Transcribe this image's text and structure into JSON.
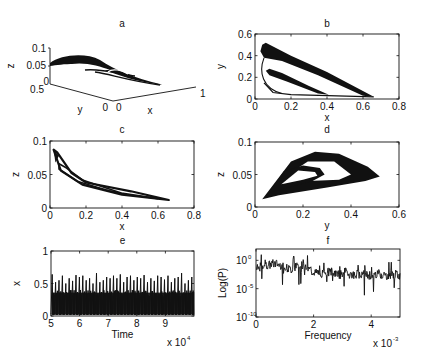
{
  "figure": {
    "background": "#ffffff",
    "ink": "#111111"
  },
  "chart_data": [
    {
      "id": "a",
      "title": "a",
      "type": "line3d",
      "xlabel": "x",
      "ylabel": "y",
      "zlabel": "z",
      "xlim": [
        0,
        1
      ],
      "ylim": [
        0,
        0.5
      ],
      "zlim": [
        0,
        0.1
      ],
      "xticks": [
        "0",
        "1"
      ],
      "yticks": [
        "0",
        "0.5"
      ],
      "zticks": [
        "0",
        "0.05",
        "0.1"
      ],
      "description": "3D phase portrait of chaotic attractor (x,y,z)"
    },
    {
      "id": "b",
      "title": "b",
      "type": "line",
      "xlabel": "x",
      "ylabel": "y",
      "xlim": [
        0,
        0.8
      ],
      "ylim": [
        0,
        0.6
      ],
      "xticks": [
        "0",
        "0.2",
        "0.4",
        "0.6",
        "0.8"
      ],
      "yticks": [
        "0",
        "0.2",
        "0.4",
        "0.6"
      ],
      "outer_band": [
        [
          0.04,
          0.5
        ],
        [
          0.06,
          0.52
        ],
        [
          0.2,
          0.4
        ],
        [
          0.4,
          0.25
        ],
        [
          0.66,
          0.02
        ],
        [
          0.6,
          0.03
        ],
        [
          0.35,
          0.22
        ],
        [
          0.15,
          0.35
        ],
        [
          0.05,
          0.38
        ],
        [
          0.03,
          0.44
        ]
      ],
      "inner_band": [
        [
          0.06,
          0.26
        ],
        [
          0.08,
          0.28
        ],
        [
          0.15,
          0.24
        ],
        [
          0.3,
          0.12
        ],
        [
          0.41,
          0.04
        ],
        [
          0.35,
          0.05
        ],
        [
          0.18,
          0.16
        ],
        [
          0.08,
          0.22
        ]
      ],
      "floor_line": [
        [
          0.05,
          0.15
        ],
        [
          0.1,
          0.06
        ],
        [
          0.2,
          0.04
        ],
        [
          0.66,
          0.02
        ]
      ]
    },
    {
      "id": "c",
      "title": "c",
      "type": "line",
      "xlabel": "x",
      "ylabel": "z",
      "xlim": [
        0,
        0.8
      ],
      "ylim": [
        0,
        0.1
      ],
      "xticks": [
        "0",
        "0.2",
        "0.4",
        "0.6",
        "0.8"
      ],
      "yticks": [
        "0",
        "0.05",
        "0.1"
      ],
      "loops": [
        [
          [
            0.66,
            0.012
          ],
          [
            0.4,
            0.02
          ],
          [
            0.18,
            0.035
          ],
          [
            0.06,
            0.056
          ],
          [
            0.02,
            0.087
          ],
          [
            0.04,
            0.083
          ],
          [
            0.12,
            0.052
          ],
          [
            0.2,
            0.038
          ],
          [
            0.45,
            0.025
          ],
          [
            0.66,
            0.012
          ]
        ],
        [
          [
            0.6,
            0.014
          ],
          [
            0.35,
            0.024
          ],
          [
            0.15,
            0.04
          ],
          [
            0.05,
            0.058
          ],
          [
            0.05,
            0.066
          ],
          [
            0.09,
            0.06
          ],
          [
            0.18,
            0.042
          ],
          [
            0.4,
            0.022
          ],
          [
            0.6,
            0.014
          ]
        ]
      ]
    },
    {
      "id": "d",
      "title": "d",
      "type": "line",
      "xlabel": "y",
      "ylabel": "z",
      "xlim": [
        0,
        0.6
      ],
      "ylim": [
        0,
        0.1
      ],
      "xticks": [
        "0",
        "0.2",
        "0.4",
        "0.6"
      ],
      "yticks": [
        "0",
        "0.05",
        "0.1"
      ],
      "outer_band": [
        [
          0.03,
          0.012
        ],
        [
          0.15,
          0.07
        ],
        [
          0.25,
          0.085
        ],
        [
          0.35,
          0.082
        ],
        [
          0.47,
          0.062
        ],
        [
          0.52,
          0.047
        ],
        [
          0.46,
          0.04
        ],
        [
          0.3,
          0.03
        ],
        [
          0.1,
          0.018
        ],
        [
          0.03,
          0.012
        ]
      ],
      "inner_band": [
        [
          0.06,
          0.022
        ],
        [
          0.12,
          0.055
        ],
        [
          0.2,
          0.064
        ],
        [
          0.27,
          0.06
        ],
        [
          0.29,
          0.05
        ],
        [
          0.24,
          0.04
        ],
        [
          0.12,
          0.028
        ],
        [
          0.06,
          0.022
        ]
      ],
      "hole_outer": [
        [
          0.13,
          0.048
        ],
        [
          0.22,
          0.07
        ],
        [
          0.33,
          0.07
        ],
        [
          0.4,
          0.05
        ],
        [
          0.35,
          0.042
        ],
        [
          0.22,
          0.04
        ]
      ],
      "hole_inner": [
        [
          0.11,
          0.035
        ],
        [
          0.18,
          0.056
        ],
        [
          0.25,
          0.054
        ],
        [
          0.26,
          0.048
        ],
        [
          0.2,
          0.042
        ]
      ]
    },
    {
      "id": "e",
      "title": "e",
      "type": "line",
      "xlabel": "Time",
      "ylabel": "x",
      "xlim": [
        5,
        10
      ],
      "ylim": [
        0,
        1
      ],
      "xticks": [
        "5",
        "6",
        "7",
        "8",
        "9"
      ],
      "yticks": [
        "0",
        "0.5",
        "1"
      ],
      "x_multiplier": "x 10",
      "x_multiplier_exp": "4",
      "peaks": [
        0.64,
        0.52,
        0.55,
        0.62,
        0.5,
        0.58,
        0.54,
        0.63,
        0.6,
        0.62,
        0.55,
        0.58,
        0.5,
        0.66,
        0.52,
        0.55,
        0.6,
        0.58,
        0.62,
        0.58,
        0.64,
        0.52,
        0.6,
        0.62,
        0.55,
        0.6,
        0.58,
        0.63,
        0.52,
        0.58,
        0.54,
        0.62,
        0.6,
        0.56,
        0.62,
        0.52,
        0.58,
        0.6,
        0.66,
        0.5,
        0.55,
        0.6
      ]
    },
    {
      "id": "f",
      "title": "f",
      "type": "line",
      "xlabel": "Frequency",
      "ylabel": "Log(P)",
      "xlim": [
        0,
        5
      ],
      "ylim": [
        -10,
        2
      ],
      "yscale": "log",
      "xticks": [
        "0",
        "2",
        "4"
      ],
      "yticks": [
        "10",
        "10",
        "10"
      ],
      "ytick_exps": [
        "0",
        "-5",
        "-10"
      ],
      "x_multiplier": "x 10",
      "x_multiplier_exp": "-3",
      "baseline_log": [
        -1.5,
        -1.2,
        -1.0,
        -0.8,
        -0.6,
        -0.6,
        -0.8,
        -1.0,
        -1.4,
        -1.6,
        -1.2,
        -0.9,
        -0.9,
        -1.2,
        -1.6,
        -2.0,
        -2.2,
        -2.4,
        -2.2,
        -2.1,
        -2.0,
        -2.3,
        -2.5,
        -2.2,
        -2.1,
        -2.4,
        -2.6,
        -2.4,
        -2.3,
        -2.5,
        -2.6,
        -2.7,
        -2.5,
        -2.4,
        -2.6,
        -2.7,
        -2.6,
        -2.5,
        -2.6,
        -2.7
      ]
    }
  ]
}
